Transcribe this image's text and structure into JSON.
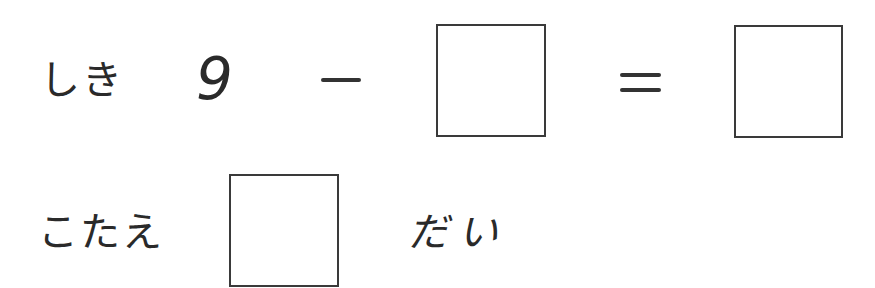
{
  "worksheet": {
    "equation_row": {
      "label": "しき",
      "operand": "9",
      "operator": "−",
      "equals": "=",
      "blank_operand": "",
      "blank_result": ""
    },
    "answer_row": {
      "label": "こたえ",
      "blank_answer": "",
      "unit": "だい"
    }
  }
}
